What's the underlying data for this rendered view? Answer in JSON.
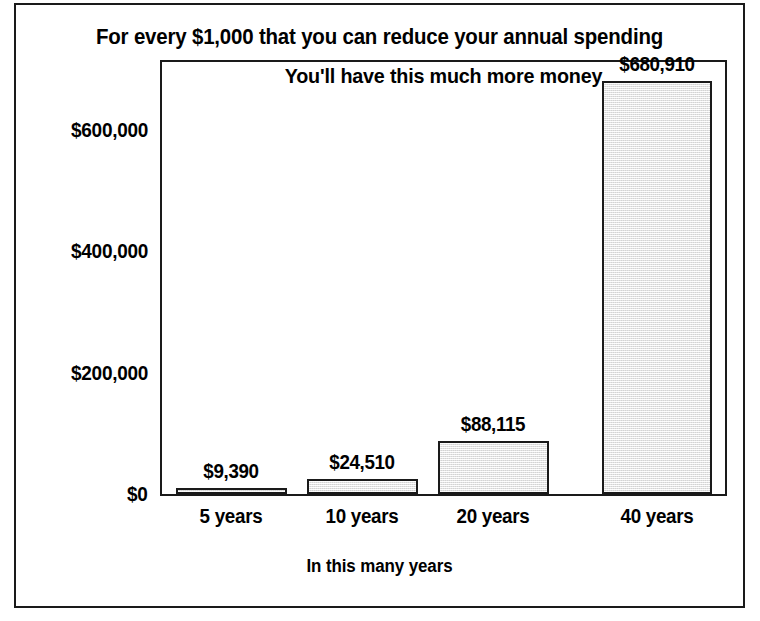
{
  "chart_data": {
    "type": "bar",
    "title": "For every $1,000 that you can reduce your annual spending",
    "subtitle": "You'll have this much more money",
    "xlabel": "In this many years",
    "ylabel": "",
    "categories": [
      "5 years",
      "10 years",
      "20 years",
      "40 years"
    ],
    "values": [
      9390,
      24510,
      88115,
      680910
    ],
    "data_labels": [
      "$9,390",
      "$24,510",
      "$88,115",
      "$680,910"
    ],
    "ylim": [
      0,
      680910
    ],
    "y_ticks": [
      0,
      200000,
      400000,
      600000
    ],
    "y_tick_labels": [
      "$0",
      "$200,000",
      "$400,000",
      "$600,000"
    ],
    "grid": false,
    "legend": false,
    "bar_fill_color": "#ebebeb",
    "bar_border_color": "#1a1a1a",
    "text_color": "#000000",
    "background_color": "#ffffff"
  },
  "axis": {
    "y_labels": [
      {
        "text": "$600,000",
        "value": 600000
      },
      {
        "text": "$400,000",
        "value": 400000
      },
      {
        "text": "$200,000",
        "value": 200000
      },
      {
        "text": "$0",
        "value": 0
      }
    ]
  }
}
